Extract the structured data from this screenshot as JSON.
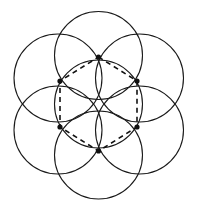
{
  "figure": {
    "type": "geometric-diagram",
    "canvas": {
      "width": 197,
      "height": 213
    },
    "background_color": "#ffffff",
    "stroke_color": "#1a1a1a",
    "circle_stroke_width": 1.1,
    "dash_stroke_color": "#111111",
    "dash_stroke_width": 1.6,
    "dash_pattern": "5,4",
    "vertex_marker_color": "#111111",
    "vertex_marker_radius": 2.6,
    "circles": [
      {
        "name": "circle-center",
        "cx": 98.5,
        "cy": 104.0,
        "r": 44.0
      },
      {
        "name": "circle-top",
        "cx": 98.5,
        "cy": 55.5,
        "r": 44.0
      },
      {
        "name": "circle-upper-left",
        "cx": 58.0,
        "cy": 78.0,
        "r": 44.0
      },
      {
        "name": "circle-upper-right",
        "cx": 139.5,
        "cy": 78.0,
        "r": 44.0
      },
      {
        "name": "circle-lower-left",
        "cx": 58.0,
        "cy": 130.0,
        "r": 44.0
      },
      {
        "name": "circle-lower-right",
        "cx": 139.5,
        "cy": 130.0,
        "r": 44.0
      },
      {
        "name": "circle-bottom",
        "cx": 98.5,
        "cy": 155.0,
        "r": 44.0
      }
    ],
    "hexagon": {
      "name": "dashed-hexagon",
      "points": "98.5,57 137,81 137,127 98.5,151 60,127 60,81",
      "vertices": [
        {
          "name": "vertex-top",
          "x": 98.5,
          "y": 57.0
        },
        {
          "name": "vertex-upper-right",
          "x": 137.0,
          "y": 81.0
        },
        {
          "name": "vertex-lower-right",
          "x": 137.0,
          "y": 127.0
        },
        {
          "name": "vertex-bottom",
          "x": 98.5,
          "y": 151.0
        },
        {
          "name": "vertex-lower-left",
          "x": 60.0,
          "y": 127.0
        },
        {
          "name": "vertex-upper-left",
          "x": 60.0,
          "y": 81.0
        }
      ]
    }
  }
}
